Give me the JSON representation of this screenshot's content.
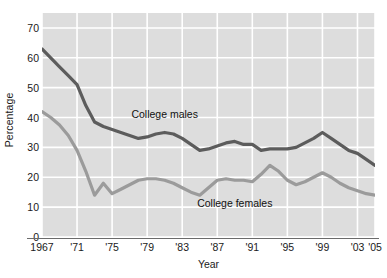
{
  "chart_data": {
    "type": "line",
    "title": "",
    "xlabel": "Year",
    "ylabel": "Percentage",
    "ylim": [
      0,
      75
    ],
    "xlim": [
      1967,
      2005
    ],
    "grid": true,
    "legend_position": "inline-annotations",
    "y_ticks": [
      0,
      10,
      20,
      30,
      40,
      50,
      60,
      70
    ],
    "y_tick_labels": [
      "0",
      "10",
      "20",
      "30",
      "40",
      "50",
      "60",
      "70"
    ],
    "x_ticks": [
      1967,
      1971,
      1975,
      1979,
      1983,
      1987,
      1991,
      1995,
      1999,
      2003,
      2005
    ],
    "x_tick_labels": [
      "1967",
      "'71",
      "'75",
      "'79",
      "'83",
      "'87",
      "'91",
      "'95",
      "'99",
      "'03",
      "'05"
    ],
    "x": [
      1967,
      1968,
      1969,
      1970,
      1971,
      1972,
      1973,
      1974,
      1975,
      1976,
      1977,
      1978,
      1979,
      1980,
      1981,
      1982,
      1983,
      1984,
      1985,
      1986,
      1987,
      1988,
      1989,
      1990,
      1991,
      1992,
      1993,
      1994,
      1995,
      1996,
      1997,
      1998,
      1999,
      2000,
      2001,
      2002,
      2003,
      2004,
      2005
    ],
    "series": [
      {
        "name": "College males",
        "color": "#5c5c5c",
        "values": [
          63,
          60,
          57,
          54,
          51,
          44,
          38.5,
          37,
          36,
          35,
          34,
          33,
          33.5,
          34.5,
          35,
          34.5,
          33,
          31,
          29,
          29.5,
          30.5,
          31.5,
          32,
          31,
          31,
          29,
          29.5,
          29.5,
          29.5,
          30,
          31.5,
          33,
          35,
          33,
          31,
          29,
          28,
          26,
          24
        ],
        "label_text": "College males",
        "label_x": 1981,
        "label_y": 41
      },
      {
        "name": "College females",
        "color": "#9b9b9b",
        "values": [
          42,
          40,
          37.5,
          34,
          29,
          22,
          14,
          18,
          14.5,
          16,
          17.5,
          19,
          19.5,
          19.5,
          19,
          18,
          16.5,
          15,
          14,
          16.5,
          19,
          19.5,
          19,
          19,
          18.5,
          21,
          24,
          22,
          19,
          17.5,
          18.5,
          20,
          21.5,
          20,
          18,
          16.5,
          15.5,
          14.5,
          14
        ],
        "label_text": "College females",
        "label_x": 1989,
        "label_y": 11
      }
    ],
    "colors": {
      "plot_background": "#dddddd",
      "gridline": "#ffffff",
      "axis_line": "#6b6b6b",
      "page_background": "#ffffff",
      "text": "#1a1a1a"
    }
  }
}
